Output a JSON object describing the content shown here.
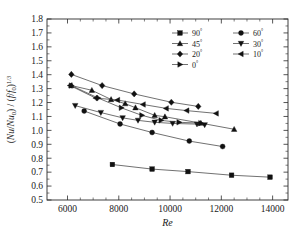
{
  "chart_data": {
    "type": "line",
    "title": "",
    "xlabel": "Re",
    "ylabel": "(Nu/Nu0)/(f/f0)^(1/3)",
    "xlim": [
      5200,
      14600
    ],
    "ylim": [
      0.5,
      1.8
    ],
    "xticks": [
      6000,
      8000,
      10000,
      12000,
      14000
    ],
    "yticks": [
      0.5,
      0.6,
      0.7,
      0.8,
      0.9,
      1.0,
      1.1,
      1.2,
      1.3,
      1.4,
      1.5,
      1.6,
      1.7,
      1.8
    ],
    "grid": false,
    "legend_position": "top-right",
    "series": [
      {
        "name": "90°",
        "marker": "square",
        "x": [
          7750,
          9300,
          10700,
          12400,
          13900
        ],
        "y": [
          0.755,
          0.722,
          0.704,
          0.678,
          0.664
        ]
      },
      {
        "name": "60°",
        "marker": "circle",
        "x": [
          6650,
          8050,
          9300,
          10750,
          12050
        ],
        "y": [
          1.139,
          1.046,
          0.985,
          0.923,
          0.884
        ]
      },
      {
        "name": "45°",
        "marker": "triangle-up",
        "x": [
          6150,
          6950,
          7700,
          8250,
          8650,
          9400,
          9800,
          11200,
          12500
        ],
        "y": [
          1.322,
          1.288,
          1.222,
          1.192,
          1.163,
          1.108,
          1.098,
          1.052,
          1.008
        ]
      },
      {
        "name": "30°",
        "marker": "triangle-down",
        "x": [
          6300,
          7300,
          8150,
          8750,
          9400,
          10100,
          11050,
          11350
        ],
        "y": [
          1.178,
          1.128,
          1.09,
          1.072,
          1.058,
          1.05,
          1.045,
          1.04
        ]
      },
      {
        "name": "20°",
        "marker": "diamond",
        "x": [
          6150,
          7350,
          8600,
          10050,
          11100
        ],
        "y": [
          1.402,
          1.322,
          1.262,
          1.202,
          1.172
        ]
      },
      {
        "name": "10°",
        "marker": "triangle-left",
        "x": [
          6100,
          7100,
          7950,
          8950,
          9850,
          10650,
          11800
        ],
        "y": [
          1.322,
          1.232,
          1.218,
          1.186,
          1.158,
          1.142,
          1.122
        ]
      },
      {
        "name": "0°",
        "marker": "triangle-right",
        "x": [
          6150,
          7200,
          8100,
          8900,
          9650,
          10350,
          11200
        ],
        "y": [
          1.322,
          1.232,
          1.162,
          1.108,
          1.072,
          1.058,
          1.052
        ]
      }
    ]
  },
  "legend": {
    "entries": [
      {
        "label": "90",
        "degree": "°",
        "marker": "square"
      },
      {
        "label": "60",
        "degree": "°",
        "marker": "circle"
      },
      {
        "label": "45",
        "degree": "°",
        "marker": "triangle-up"
      },
      {
        "label": "30",
        "degree": "°",
        "marker": "triangle-down"
      },
      {
        "label": "20",
        "degree": "°",
        "marker": "diamond"
      },
      {
        "label": "10",
        "degree": "°",
        "marker": "triangle-left"
      },
      {
        "label": "0",
        "degree": "°",
        "marker": "triangle-right"
      }
    ]
  },
  "axes": {
    "x_title": "Re",
    "y_title_parts": {
      "open1": "(",
      "nu": "Nu",
      "slash1": "/",
      "nu0_base": "Nu",
      "nu0_sub": "0",
      "close1": ")",
      "slash2": " / ",
      "open2": "(",
      "f": "f",
      "slash3": "/",
      "f0_base": "f",
      "f0_sub": "0",
      "close2": ")",
      "exp": "1/3"
    },
    "x_tick_labels": [
      "6000",
      "8000",
      "10000",
      "12000",
      "14000"
    ],
    "y_tick_labels": [
      "0.5",
      "0.6",
      "0.7",
      "0.8",
      "0.9",
      "1.0",
      "1.1",
      "1.2",
      "1.3",
      "1.4",
      "1.5",
      "1.6",
      "1.7",
      "1.8"
    ]
  },
  "colors": {
    "background": "#ffffff",
    "axis": "#2b2b2b",
    "line": "#333333",
    "marker": "#111111",
    "text": "#1a1a1a"
  }
}
